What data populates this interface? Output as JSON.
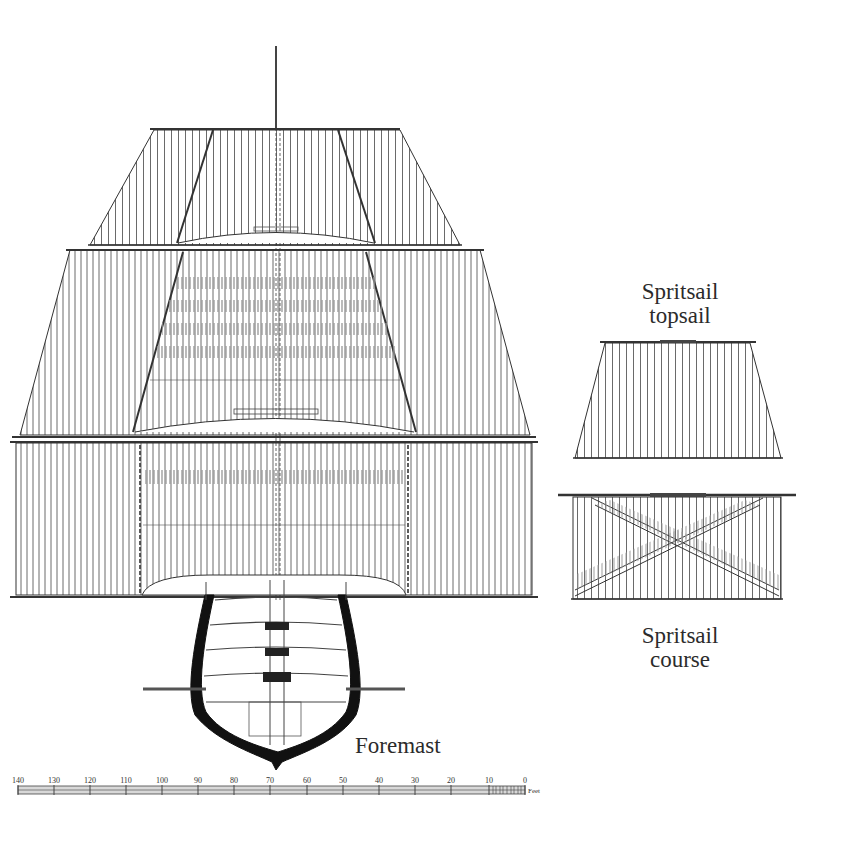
{
  "labels": {
    "foremast": "Foremast",
    "spritsail_topsail_line1": "Spritsail",
    "spritsail_topsail_line2": "topsail",
    "spritsail_course_line1": "Spritsail",
    "spritsail_course_line2": "course"
  },
  "scale_bar": {
    "unit": "Feet",
    "ticks": [
      "140",
      "130",
      "120",
      "110",
      "100",
      "90",
      "80",
      "70",
      "60",
      "50",
      "40",
      "30",
      "20",
      "10",
      "0"
    ]
  },
  "colors": {
    "line": "#3a3a3a",
    "hull": "#111111",
    "background": "#ffffff",
    "shade": "#9a9a9a"
  }
}
